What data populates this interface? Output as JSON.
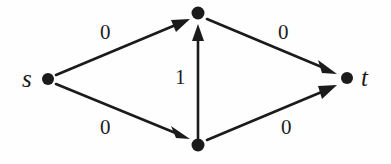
{
  "figure": {
    "background_color": "#fefefe",
    "stroke_color": "#1b1b1b"
  },
  "graph": {
    "nodes": [
      {
        "id": "s",
        "label": "s",
        "label_position": "left",
        "x": 48,
        "y": 79,
        "radius": 6
      },
      {
        "id": "top",
        "label": "",
        "label_position": "none",
        "x": 198,
        "y": 13,
        "radius": 6.5
      },
      {
        "id": "bottom",
        "label": "",
        "label_position": "none",
        "x": 198,
        "y": 145,
        "radius": 6.5
      },
      {
        "id": "t",
        "label": "t",
        "label_position": "right",
        "x": 347,
        "y": 78,
        "radius": 6
      }
    ],
    "edges": [
      {
        "from": "s",
        "to": "top",
        "label": "0",
        "directed": true
      },
      {
        "from": "top",
        "to": "t",
        "label": "0",
        "directed": true
      },
      {
        "from": "s",
        "to": "bottom",
        "label": "0",
        "directed": true
      },
      {
        "from": "bottom",
        "to": "t",
        "label": "0",
        "directed": true
      },
      {
        "from": "bottom",
        "to": "top",
        "label": "1",
        "directed": true
      }
    ]
  }
}
